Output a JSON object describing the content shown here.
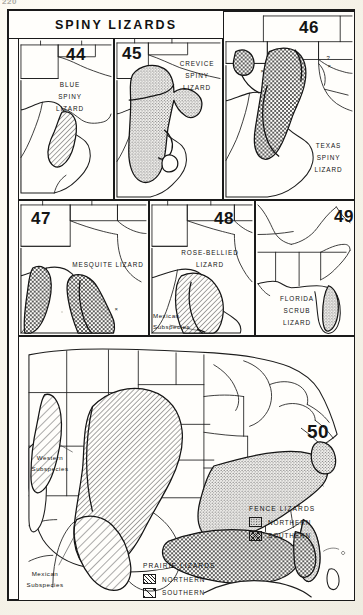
{
  "page": {
    "number": "220"
  },
  "plate": {
    "title": "SPINY LIZARDS",
    "panels": [
      {
        "id": "44",
        "number": "44",
        "caption": "BLUE\nSPINY\nLIZARD",
        "pattern": "diagonal-hatch"
      },
      {
        "id": "45",
        "number": "45",
        "caption": "CREVICE\nSPINY\nLIZARD",
        "pattern": "stipple"
      },
      {
        "id": "46",
        "number": "46",
        "caption": "TEXAS\nSPINY\nLIZARD",
        "pattern": "crosshatch",
        "markers": [
          "x",
          "x"
        ],
        "query_marker": "?"
      },
      {
        "id": "47",
        "number": "47",
        "caption": "MESQUITE  LIZARD",
        "pattern": "crosshatch",
        "markers": [
          "x"
        ]
      },
      {
        "id": "48",
        "number": "48",
        "caption": "ROSE-BELLIED\nLIZARD",
        "pattern": "diagonal-hatch",
        "annotation": "Mexican\nSubspecies"
      },
      {
        "id": "49",
        "number": "49",
        "caption": "FLORIDA\nSCRUB\nLIZARD",
        "pattern": "stipple"
      },
      {
        "id": "50",
        "number": "50",
        "caption": "",
        "annotations": [
          "Western\nSubspecies",
          "Mexican\nSubspecies"
        ]
      }
    ],
    "legends": [
      {
        "id": "fence-lizards",
        "title": "FENCE LIZARDS",
        "entries": [
          {
            "label": "NORTHERN",
            "pattern": "stipple"
          },
          {
            "label": "SOUTHERN",
            "pattern": "crosshatch"
          }
        ]
      },
      {
        "id": "prairie-lizards",
        "title": "PRAIRIE LIZARDS",
        "entries": [
          {
            "label": "NORTHERN",
            "pattern": "diagonal-dense"
          },
          {
            "label": "SOUTHERN",
            "pattern": "diagonal-sparse"
          }
        ]
      }
    ]
  }
}
